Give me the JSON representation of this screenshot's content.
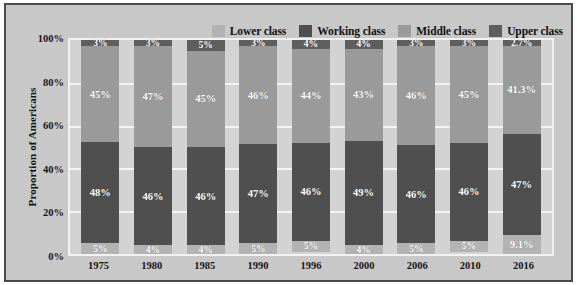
{
  "legend": {
    "position": "top-right",
    "items": [
      {
        "label": "Lower class",
        "color": "#b3b3b3",
        "swatch_name": "legend-swatch-lower-class"
      },
      {
        "label": "Working class",
        "color": "#4f4f4f",
        "swatch_name": "legend-swatch-working-class"
      },
      {
        "label": "Middle class",
        "color": "#9a9a9a",
        "swatch_name": "legend-swatch-middle-class"
      },
      {
        "label": "Upper class",
        "color": "#5e5e5e",
        "swatch_name": "legend-swatch-upper-class"
      }
    ]
  },
  "axes": {
    "ylabel": "Proportion of Americans",
    "yticks": [
      "0%",
      "20%",
      "40%",
      "60%",
      "80%",
      "100%"
    ],
    "ytick_values": [
      0,
      20,
      40,
      60,
      80,
      100
    ],
    "ylim": [
      0,
      100
    ],
    "xlabel": "",
    "grid": true
  },
  "colors": {
    "background": "#c8c8c8",
    "plot_background": "#d3d3d3",
    "gridline": "#f4f4f4",
    "frame_border": "#4a4a4a",
    "plot_border": "#f2f2f2",
    "label_text": "#ffffff",
    "axis_text": "#161616"
  },
  "chart_data": {
    "type": "bar",
    "stacked": true,
    "title": "",
    "xlabel": "",
    "ylabel": "Proportion of Americans",
    "ylim": [
      0,
      100
    ],
    "grid": true,
    "legend_position": "top-right",
    "categories": [
      "1975",
      "1980",
      "1985",
      "1990",
      "1996",
      "2000",
      "2006",
      "2010",
      "2016"
    ],
    "series": [
      {
        "name": "Lower class",
        "color": "#b3b3b3",
        "values": [
          5,
          4,
          4,
          5,
          5,
          4,
          5,
          5,
          9.1
        ],
        "labels": [
          "5%",
          "4%",
          "4%",
          "5%",
          "5%",
          "4%",
          "5%",
          "5%",
          "9.1%"
        ]
      },
      {
        "name": "Working class",
        "color": "#4f4f4f",
        "values": [
          48,
          46,
          46,
          47,
          46,
          49,
          46,
          46,
          47
        ],
        "labels": [
          "48%",
          "46%",
          "46%",
          "47%",
          "46%",
          "49%",
          "46%",
          "46%",
          "47%"
        ]
      },
      {
        "name": "Middle class",
        "color": "#9a9a9a",
        "values": [
          45,
          47,
          45,
          46,
          44,
          43,
          46,
          45,
          41.3
        ],
        "labels": [
          "45%",
          "47%",
          "45%",
          "46%",
          "44%",
          "43%",
          "46%",
          "45%",
          "41.3%"
        ]
      },
      {
        "name": "Upper class",
        "color": "#5e5e5e",
        "values": [
          3,
          3,
          5,
          3,
          4,
          4,
          3,
          3,
          2.7
        ],
        "labels": [
          "3%",
          "3%",
          "5%",
          "3%",
          "4%",
          "4%",
          "3%",
          "3%",
          "2.7%"
        ]
      }
    ]
  }
}
